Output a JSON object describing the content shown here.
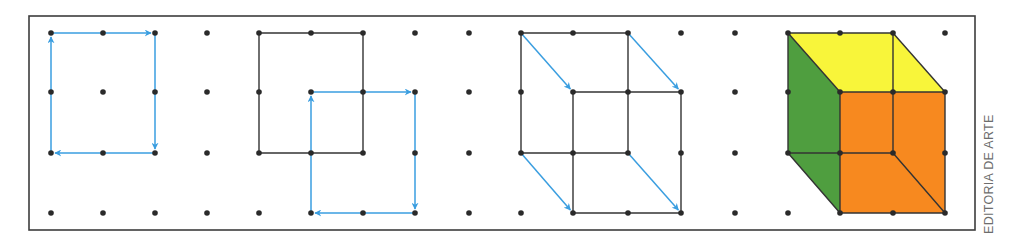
{
  "credit": "EDITORIA DE ARTE",
  "colors": {
    "frame": "#3d3d3d",
    "dot": "#2a2a2a",
    "edge": "#333333",
    "arrow": "#3a9ee0",
    "top_face": "#f8f53a",
    "front_face": "#f7891f",
    "side_face": "#4f9e3f"
  },
  "frame": {
    "x": 29,
    "y": 16,
    "width": 946,
    "height": 214
  },
  "grid": {
    "columns_x": [
      51,
      103,
      155,
      207,
      259,
      311,
      363,
      415,
      469,
      521,
      573,
      628,
      681,
      735,
      788,
      840,
      893,
      945
    ],
    "rows_y": [
      33,
      92,
      153,
      213
    ]
  },
  "panels": [
    {
      "name": "step-1-square-path",
      "black_segments": [],
      "arrows": [
        [
          [
            51,
            153
          ],
          [
            51,
            33
          ]
        ],
        [
          [
            51,
            33
          ],
          [
            155,
            33
          ]
        ],
        [
          [
            155,
            33
          ],
          [
            155,
            153
          ]
        ],
        [
          [
            155,
            153
          ],
          [
            51,
            153
          ]
        ]
      ]
    },
    {
      "name": "step-2-shifted-square",
      "black_segments": [
        [
          [
            259,
            33
          ],
          [
            363,
            33
          ]
        ],
        [
          [
            363,
            33
          ],
          [
            363,
            153
          ]
        ],
        [
          [
            363,
            153
          ],
          [
            259,
            153
          ]
        ],
        [
          [
            259,
            153
          ],
          [
            259,
            33
          ]
        ]
      ],
      "arrows": [
        [
          [
            311,
            213
          ],
          [
            311,
            92
          ]
        ],
        [
          [
            311,
            92
          ],
          [
            415,
            92
          ]
        ],
        [
          [
            415,
            92
          ],
          [
            415,
            213
          ]
        ],
        [
          [
            415,
            213
          ],
          [
            311,
            213
          ]
        ]
      ]
    },
    {
      "name": "step-3-connect-vertices",
      "black_segments": [
        [
          [
            521,
            33
          ],
          [
            628,
            33
          ]
        ],
        [
          [
            628,
            33
          ],
          [
            628,
            153
          ]
        ],
        [
          [
            628,
            153
          ],
          [
            521,
            153
          ]
        ],
        [
          [
            521,
            153
          ],
          [
            521,
            33
          ]
        ],
        [
          [
            573,
            92
          ],
          [
            681,
            92
          ]
        ],
        [
          [
            681,
            92
          ],
          [
            681,
            213
          ]
        ],
        [
          [
            681,
            213
          ],
          [
            573,
            213
          ]
        ],
        [
          [
            573,
            213
          ],
          [
            573,
            92
          ]
        ]
      ],
      "arrows": [
        [
          [
            521,
            33
          ],
          [
            573,
            92
          ]
        ],
        [
          [
            628,
            33
          ],
          [
            681,
            92
          ]
        ],
        [
          [
            521,
            153
          ],
          [
            573,
            213
          ]
        ],
        [
          [
            628,
            153
          ],
          [
            681,
            213
          ]
        ]
      ]
    },
    {
      "name": "step-4-colored-cube",
      "faces": [
        {
          "name": "top-face",
          "color_key": "top_face",
          "points": [
            [
              788,
              33
            ],
            [
              893,
              33
            ],
            [
              945,
              92
            ],
            [
              840,
              92
            ]
          ]
        },
        {
          "name": "side-face",
          "color_key": "side_face",
          "points": [
            [
              788,
              33
            ],
            [
              840,
              92
            ],
            [
              840,
              213
            ],
            [
              788,
              153
            ]
          ]
        },
        {
          "name": "front-face",
          "color_key": "front_face",
          "points": [
            [
              840,
              92
            ],
            [
              945,
              92
            ],
            [
              945,
              213
            ],
            [
              840,
              213
            ]
          ]
        }
      ],
      "black_segments": [
        [
          [
            788,
            33
          ],
          [
            893,
            33
          ]
        ],
        [
          [
            893,
            33
          ],
          [
            893,
            153
          ]
        ],
        [
          [
            893,
            153
          ],
          [
            788,
            153
          ]
        ],
        [
          [
            788,
            153
          ],
          [
            788,
            33
          ]
        ],
        [
          [
            840,
            92
          ],
          [
            945,
            92
          ]
        ],
        [
          [
            945,
            92
          ],
          [
            945,
            213
          ]
        ],
        [
          [
            945,
            213
          ],
          [
            840,
            213
          ]
        ],
        [
          [
            840,
            213
          ],
          [
            840,
            92
          ]
        ],
        [
          [
            788,
            33
          ],
          [
            840,
            92
          ]
        ],
        [
          [
            893,
            33
          ],
          [
            945,
            92
          ]
        ],
        [
          [
            788,
            153
          ],
          [
            840,
            213
          ]
        ],
        [
          [
            893,
            153
          ],
          [
            945,
            213
          ]
        ]
      ],
      "arrows": []
    }
  ]
}
